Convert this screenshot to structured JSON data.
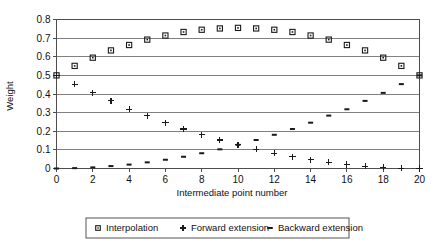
{
  "chart_data": {
    "type": "scatter",
    "title": "",
    "xlabel": "Intermediate point number",
    "ylabel": "Weight",
    "xlim": [
      0,
      20
    ],
    "ylim": [
      0,
      0.8
    ],
    "xticks": [
      0,
      2,
      4,
      6,
      8,
      10,
      12,
      14,
      16,
      18,
      20
    ],
    "yticks": [
      0,
      0.1,
      0.2,
      0.3,
      0.4,
      0.5,
      0.6,
      0.7,
      0.8
    ],
    "xtick_labels": [
      "0",
      "2",
      "4",
      "6",
      "8",
      "10",
      "12",
      "14",
      "16",
      "18",
      "20"
    ],
    "ytick_labels": [
      "0",
      "0.1",
      "0.2",
      "0.3",
      "0.4",
      "0.5",
      "0.6",
      "0.7",
      "0.8"
    ],
    "grid": true,
    "grid_axis": "y",
    "legend_position": "bottom",
    "x": [
      0,
      1,
      2,
      3,
      4,
      5,
      6,
      7,
      8,
      9,
      10,
      11,
      12,
      13,
      14,
      15,
      16,
      17,
      18,
      19,
      20
    ],
    "series": [
      {
        "name": "Interpolation",
        "marker": "square",
        "values": [
          0.5,
          0.551,
          0.595,
          0.634,
          0.663,
          0.692,
          0.714,
          0.733,
          0.745,
          0.752,
          0.755,
          0.752,
          0.745,
          0.733,
          0.714,
          0.692,
          0.663,
          0.634,
          0.595,
          0.551,
          0.5
        ]
      },
      {
        "name": "Forward extension",
        "marker": "plus",
        "values": [
          0.5,
          0.453,
          0.406,
          0.363,
          0.318,
          0.284,
          0.246,
          0.212,
          0.181,
          0.153,
          0.127,
          0.103,
          0.082,
          0.063,
          0.047,
          0.033,
          0.021,
          0.013,
          0.006,
          0.002,
          0.0
        ]
      },
      {
        "name": "Backward extension",
        "marker": "dash",
        "values": [
          0.0,
          0.002,
          0.006,
          0.013,
          0.021,
          0.033,
          0.047,
          0.063,
          0.082,
          0.103,
          0.127,
          0.153,
          0.181,
          0.212,
          0.246,
          0.284,
          0.318,
          0.363,
          0.406,
          0.453,
          0.5
        ]
      }
    ],
    "colors": {
      "marker": "#1a1a1a",
      "gridline": "#808080",
      "axis": "#4d4d4d",
      "background": "#ffffff"
    }
  },
  "legend": {
    "items": [
      {
        "label": "Interpolation",
        "marker": "square"
      },
      {
        "label": "Forward extension",
        "marker": "plus"
      },
      {
        "label": "Backward extension",
        "marker": "dash"
      }
    ]
  }
}
